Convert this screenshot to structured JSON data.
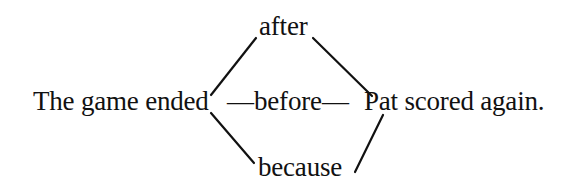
{
  "diagram": {
    "main_sentence": {
      "subject_clause": "The game ended",
      "dash_left": "—",
      "connective_middle": "before",
      "dash_right": "—",
      "object_clause": "Pat scored again."
    },
    "alternatives": {
      "top": "after",
      "bottom": "because"
    },
    "colors": {
      "text": "#111111",
      "lines": "#111111",
      "background": "#ffffff"
    }
  }
}
